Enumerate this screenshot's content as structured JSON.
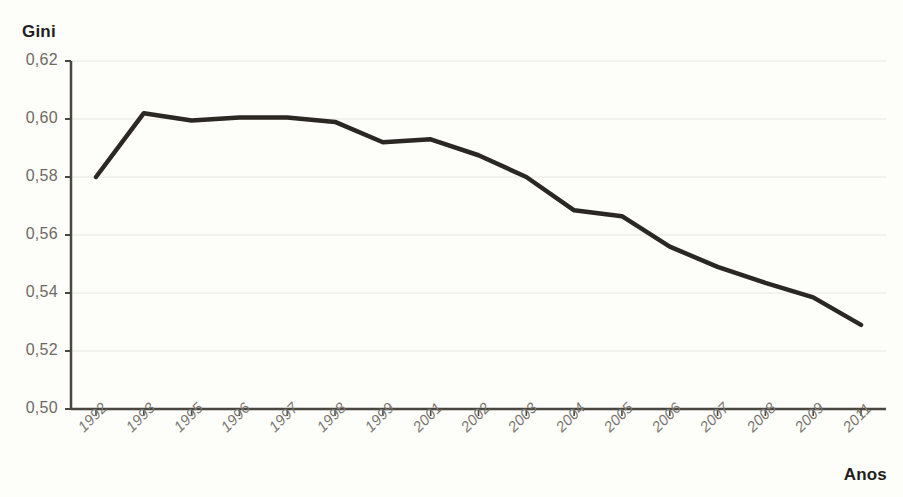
{
  "chart_data": {
    "type": "line",
    "title": "",
    "ylabel": "Gini",
    "xlabel": "Anos",
    "categories": [
      "1992",
      "1993",
      "1995",
      "1996",
      "1997",
      "1998",
      "1999",
      "2001",
      "2002",
      "2003",
      "2004",
      "2005",
      "2006",
      "2007",
      "2008",
      "2009",
      "2011"
    ],
    "values": [
      0.58,
      0.602,
      0.5995,
      0.6005,
      0.6005,
      0.599,
      0.592,
      0.593,
      0.5875,
      0.58,
      0.5685,
      0.5665,
      0.556,
      0.549,
      0.5435,
      0.5385,
      0.529
    ],
    "series": [
      {
        "name": "Gini",
        "values": [
          0.58,
          0.602,
          0.5995,
          0.6005,
          0.6005,
          0.599,
          0.592,
          0.593,
          0.5875,
          0.58,
          0.5685,
          0.5665,
          0.556,
          0.549,
          0.5435,
          0.5385,
          0.529
        ]
      }
    ],
    "ylim": [
      0.5,
      0.62
    ],
    "ytick_labels": [
      "0,62",
      "0,60",
      "0,58",
      "0,56",
      "0,54",
      "0,52",
      "0,50"
    ],
    "ytick_values": [
      0.62,
      0.6,
      0.58,
      0.56,
      0.54,
      0.52,
      0.5
    ],
    "grid": true,
    "legend": "none",
    "line_color": "#2b2722",
    "grid_color": "#e8e6df",
    "axis_color": "#4a4640",
    "background_color": "#fdfdfa"
  },
  "axes": {
    "y_title": "Gini",
    "x_title": "Anos"
  }
}
